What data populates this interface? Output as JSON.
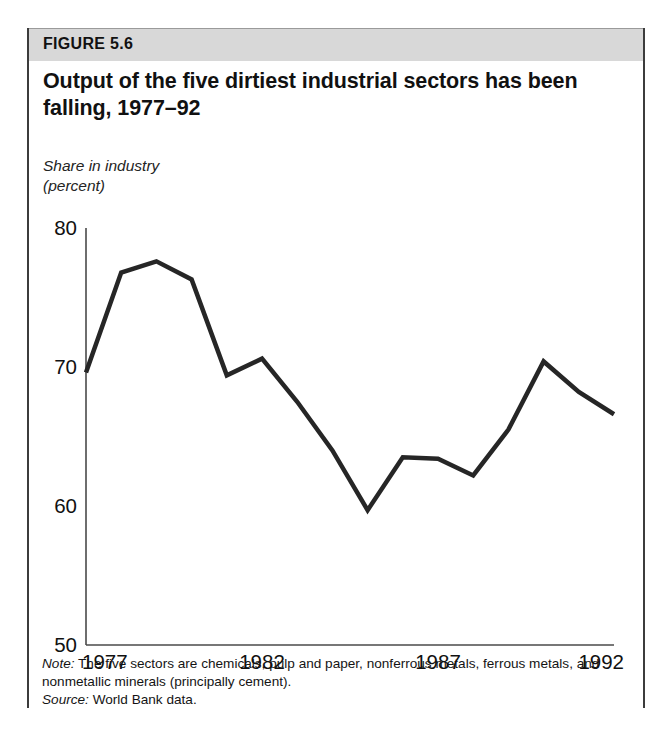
{
  "figure": {
    "band_label": "FIGURE 5.6",
    "title": "Output of the five dirtiest industrial sectors has been falling, 1977–92",
    "caption_line1": "Share in industry",
    "caption_line2": "(percent)",
    "note_lead": "Note:",
    "note_text": " The five sectors are chemicals, pulp and paper, nonferrous metals, ferrous metals, and nonmetallic minerals (principally cement).",
    "source_lead": "Source:",
    "source_text": " World Bank data.",
    "colors": {
      "band": "#d8d8d8",
      "line": "#262626",
      "axis": "#4a4a4a",
      "border": "#3c3c3c",
      "text": "#111111"
    }
  },
  "chart_data": {
    "type": "line",
    "title": "Output of the five dirtiest industrial sectors has been falling, 1977–92",
    "xlabel": "",
    "ylabel": "Share in industry (percent)",
    "x": [
      1977,
      1978,
      1979,
      1980,
      1981,
      1982,
      1983,
      1984,
      1985,
      1986,
      1987,
      1988,
      1989,
      1990,
      1991,
      1992
    ],
    "values": [
      69.6,
      76.8,
      77.6,
      76.3,
      69.4,
      70.6,
      67.5,
      64.0,
      59.7,
      63.5,
      63.4,
      62.2,
      65.5,
      70.4,
      68.2,
      66.6
    ],
    "series": [
      {
        "name": "Share in industry (percent)",
        "values": [
          69.6,
          76.8,
          77.6,
          76.3,
          69.4,
          70.6,
          67.5,
          64.0,
          59.7,
          63.5,
          63.4,
          62.2,
          65.5,
          70.4,
          68.2,
          66.6
        ]
      }
    ],
    "xlim": [
      1977,
      1992
    ],
    "ylim": [
      50,
      80
    ],
    "xticks": [
      1977,
      1982,
      1987,
      1992
    ],
    "xticklabels": [
      "1977",
      "1982",
      "1987",
      "1992"
    ],
    "yticks": [
      50,
      60,
      70,
      80
    ],
    "yticklabels": [
      "50",
      "60",
      "70",
      "80"
    ],
    "grid": false,
    "legend": false,
    "line_color": "#262626",
    "line_width": 4.5
  }
}
